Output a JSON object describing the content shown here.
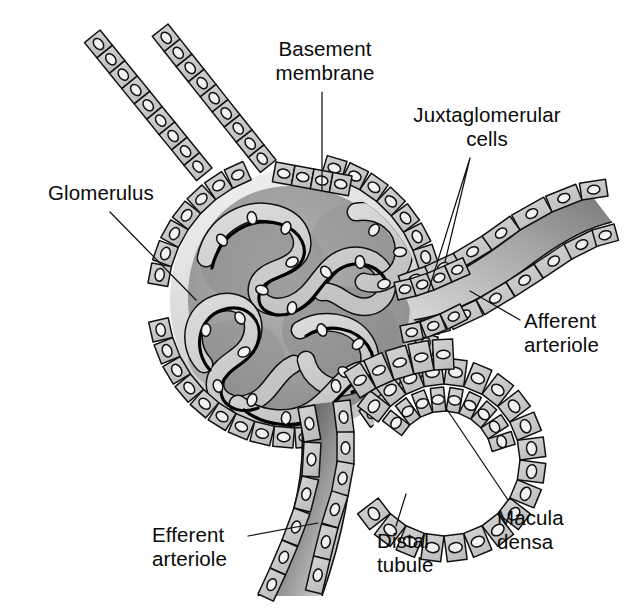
{
  "figure": {
    "background_color": "#ffffff",
    "width": 633,
    "height": 611
  },
  "palette": {
    "ink": "#111111",
    "cell_fill": "#c9c9c9",
    "cell_fill_light": "#d8d8d8",
    "nucleus_fill": "#f2f2f2",
    "capsule_space": "#9b9b9b",
    "tuft_shadow": "#8a8a8a",
    "lumen_dark": "#6e6e6e",
    "lumen_light": "#e4e4e4",
    "white": "#ffffff"
  },
  "labels": [
    {
      "id": "basement-membrane",
      "lines": [
        "Basement",
        "membrane"
      ],
      "text_x": 325,
      "text_y": 56,
      "anchor": "middle",
      "leader": "M322,92 L322,190"
    },
    {
      "id": "juxtaglomerular-cells",
      "lines": [
        "Juxtaglomerular",
        "cells"
      ],
      "text_x": 487,
      "text_y": 122,
      "anchor": "middle",
      "leader": "M470,158 L428,292 M470,158 L445,262"
    },
    {
      "id": "glomerulus",
      "lines": [
        "Glomerulus"
      ],
      "text_x": 48,
      "text_y": 200,
      "anchor": "start",
      "leader": "M110,212 L196,300"
    },
    {
      "id": "afferent-arteriole",
      "lines": [
        "Afferent",
        "arteriole"
      ],
      "text_x": 524,
      "text_y": 328,
      "anchor": "start",
      "leader": "M520,320 L470,291"
    },
    {
      "id": "efferent-arteriole",
      "lines": [
        "Efferent",
        "arteriole"
      ],
      "text_x": 152,
      "text_y": 542,
      "anchor": "start",
      "leader": "M248,536 L318,523"
    },
    {
      "id": "distal-tubule",
      "lines": [
        "Distal",
        "tubule"
      ],
      "text_x": 377,
      "text_y": 548,
      "anchor": "start",
      "leader": "M396,526 L406,494"
    },
    {
      "id": "macula-densa",
      "lines": [
        "Macula",
        "densa"
      ],
      "text_x": 497,
      "text_y": 525,
      "anchor": "start",
      "leader": "M508,500 L446,408"
    }
  ],
  "structures": {
    "glomerulus": "Capillary tuft within Bowman's capsule",
    "bowmans_capsule": "Simple squamous/cuboidal epithelial lining",
    "afferent_arteriole": "Vessel entering the glomerulus from upper right",
    "efferent_arteriole": "Vessel leaving the glomerulus toward lower left",
    "distal_tubule": "Looping tubule of cuboidal cells at lower right",
    "macula_densa": "Tall narrow cells on tubule wall adjacent to arteriole",
    "juxtaglomerular_cells": "Modified smooth muscle cells in arteriolar wall",
    "basement_membrane": "Membrane beneath the capsular epithelium"
  }
}
